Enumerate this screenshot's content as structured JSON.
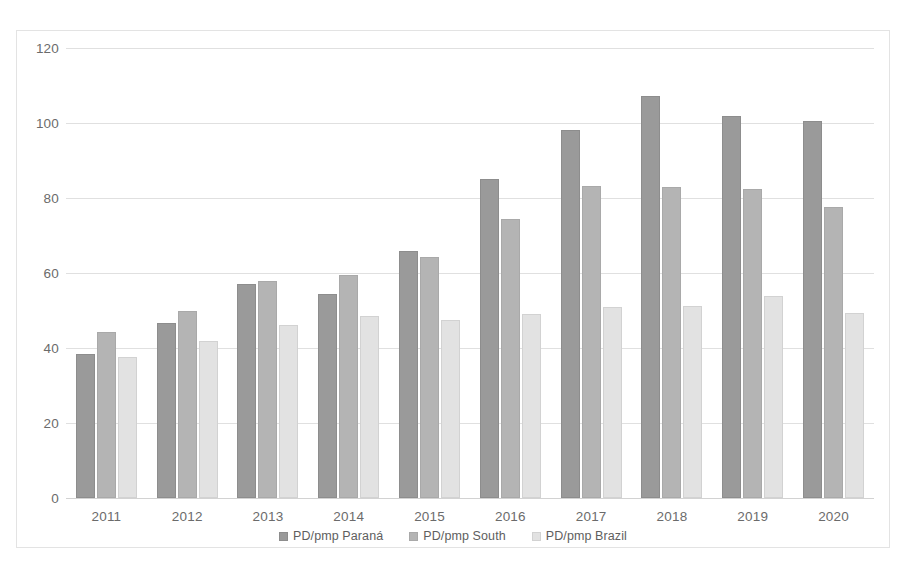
{
  "chart_data": {
    "type": "bar",
    "title": "",
    "subtitle": "",
    "xlabel": "",
    "ylabel": "",
    "grid": true,
    "legend_position": "bottom",
    "ylim": [
      0,
      120
    ],
    "yticks": [
      0,
      20,
      40,
      60,
      80,
      100,
      120
    ],
    "categories": [
      "2011",
      "2012",
      "2013",
      "2014",
      "2015",
      "2016",
      "2017",
      "2018",
      "2019",
      "2020"
    ],
    "series": [
      {
        "name": "PD/pmp Paraná",
        "color": "#9a9a9a",
        "values": [
          38.5,
          46.8,
          57.0,
          54.5,
          65.8,
          85.1,
          98.2,
          107.3,
          101.9,
          100.6
        ]
      },
      {
        "name": "PD/pmp South",
        "color": "#b4b4b4",
        "values": [
          44.4,
          50.0,
          58.0,
          59.6,
          64.4,
          74.4,
          83.1,
          83.0,
          82.3,
          77.5
        ]
      },
      {
        "name": "PD/pmp Brazil",
        "color": "#e2e2e2",
        "values": [
          37.7,
          42.0,
          46.2,
          48.6,
          47.4,
          49.2,
          51.0,
          51.1,
          53.9,
          49.4
        ]
      }
    ]
  },
  "legend": {
    "items": [
      {
        "label": "PD/pmp Paraná"
      },
      {
        "label": "PD/pmp South"
      },
      {
        "label": "PD/pmp Brazil"
      }
    ]
  }
}
